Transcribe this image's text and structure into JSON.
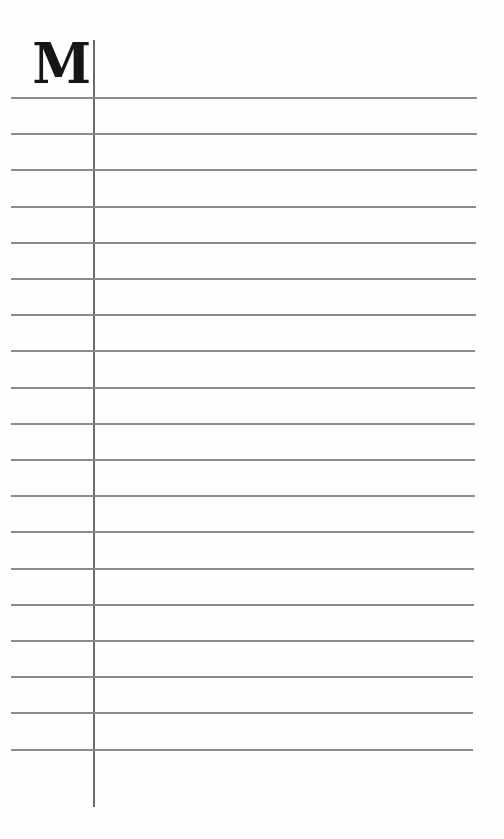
{
  "page": {
    "index_letter": "M",
    "ruled_lines": {
      "count": 19,
      "first_y": 97,
      "spacing": 36.2,
      "start_x": 11,
      "end_x_top": 477,
      "end_x_bottom": 473,
      "color": "#8a8a8a"
    },
    "margin_line": {
      "x": 93,
      "top": 40,
      "bottom": 807,
      "color": "#6b6b6b"
    },
    "background": "#fefefe"
  }
}
